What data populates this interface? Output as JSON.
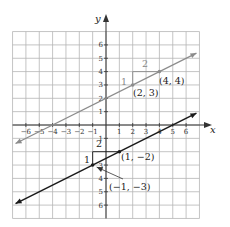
{
  "chart_data": {
    "type": "line",
    "title": "",
    "xlabel": "x",
    "ylabel": "y",
    "xlim": [
      -7,
      7
    ],
    "ylim": [
      -7,
      7
    ],
    "grid": true,
    "x_ticks": [
      -6,
      -5,
      -4,
      -3,
      -2,
      -1,
      1,
      2,
      3,
      4,
      5,
      6
    ],
    "y_ticks": [
      6,
      5,
      4,
      3,
      2,
      1,
      -1,
      -2,
      -3,
      -4,
      -5,
      -6
    ],
    "x_tick_labels": [
      "−6",
      "−5",
      "−4",
      "−3",
      "−2",
      "−1",
      "1",
      "2",
      "3",
      "4",
      "5",
      "6"
    ],
    "y_tick_labels": [
      "6",
      "5",
      "4",
      "3",
      "2",
      "1",
      "−1",
      "2",
      "3",
      "4",
      "5",
      "6"
    ],
    "series": [
      {
        "name": "upper line",
        "equation": "y = x/2 + 2",
        "color": "#8c8c8c",
        "x": [
          -7,
          7
        ],
        "y": [
          -1.5,
          5.5
        ],
        "points": [
          {
            "x": 2,
            "y": 3,
            "label": "(2, 3)"
          },
          {
            "x": 4,
            "y": 4,
            "label": "(4, 4)"
          }
        ],
        "slope_triangle": {
          "rise_label": "1",
          "run_label": "2"
        }
      },
      {
        "name": "lower line",
        "equation": "y = x/2 - 5/2",
        "color": "#1a1a1a",
        "x": [
          -7,
          7
        ],
        "y": [
          -6,
          1
        ],
        "points": [
          {
            "x": 1,
            "y": -2,
            "label": "(1, −2)"
          },
          {
            "x": -1,
            "y": -3,
            "label": "(−1, −3)"
          }
        ],
        "slope_triangle": {
          "rise_label": "1",
          "run_label": "2"
        }
      }
    ],
    "annotations": [
      "(2, 3)",
      "(4, 4)",
      "(1, −2)",
      "(−1, −3)",
      "1",
      "2",
      "1",
      "2"
    ]
  },
  "labels": {
    "x_axis": "x",
    "y_axis": "y",
    "upper": {
      "p1": "(2, 3)",
      "p2": "(4, 4)",
      "rise": "1",
      "run": "2"
    },
    "lower": {
      "p1": "(1, −2)",
      "p2": "(−1, −3)",
      "rise": "1",
      "run": "2"
    }
  },
  "ticks": {
    "x": [
      {
        "v": -6,
        "t": "−6"
      },
      {
        "v": -5,
        "t": "−5"
      },
      {
        "v": -4,
        "t": "−4"
      },
      {
        "v": -3,
        "t": "−3"
      },
      {
        "v": -2,
        "t": "−2"
      },
      {
        "v": -1,
        "t": "−1"
      },
      {
        "v": 1,
        "t": "1"
      },
      {
        "v": 2,
        "t": "2"
      },
      {
        "v": 3,
        "t": "3"
      },
      {
        "v": 4,
        "t": "4"
      },
      {
        "v": 5,
        "t": "5"
      },
      {
        "v": 6,
        "t": "6"
      }
    ],
    "y": [
      {
        "v": 6,
        "t": "6"
      },
      {
        "v": 5,
        "t": "5"
      },
      {
        "v": 4,
        "t": "4"
      },
      {
        "v": 3,
        "t": "3"
      },
      {
        "v": 2,
        "t": "2"
      },
      {
        "v": 1,
        "t": "1"
      },
      {
        "v": -1,
        "t": "1"
      },
      {
        "v": -3,
        "t": "3"
      },
      {
        "v": -4,
        "t": "4"
      },
      {
        "v": -5,
        "t": "5"
      },
      {
        "v": -6,
        "t": "6"
      }
    ]
  },
  "colors": {
    "grid": "#b5b5b5",
    "axis": "#333333",
    "upper_line": "#8c8c8c",
    "lower_line": "#1a1a1a"
  }
}
